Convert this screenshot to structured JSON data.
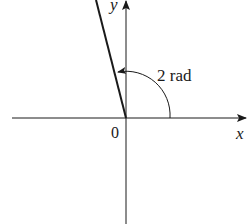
{
  "diagram": {
    "type": "angle-in-standard-position",
    "axes": {
      "x_label": "x",
      "y_label": "y",
      "origin_label": "0"
    },
    "angle": {
      "label": "2 rad",
      "value_radians": 2,
      "direction": "counterclockwise"
    },
    "colors": {
      "ink": "#1a1a1a",
      "background": "#ffffff"
    }
  }
}
